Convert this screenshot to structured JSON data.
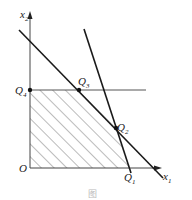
{
  "figure": {
    "type": "linear-programming-feasible-region",
    "axes": {
      "x_label": "x",
      "x_sub": "1",
      "y_label": "x",
      "y_sub": "2",
      "origin_label": "O"
    },
    "points": [
      {
        "name": "Q",
        "sub": "1"
      },
      {
        "name": "Q",
        "sub": "2"
      },
      {
        "name": "Q",
        "sub": "3"
      },
      {
        "name": "Q",
        "sub": "4"
      }
    ],
    "region": "hatched",
    "caption": "图"
  },
  "colors": {
    "line": "#1a1a1a",
    "hatch": "#555555",
    "background": "#ffffff"
  }
}
